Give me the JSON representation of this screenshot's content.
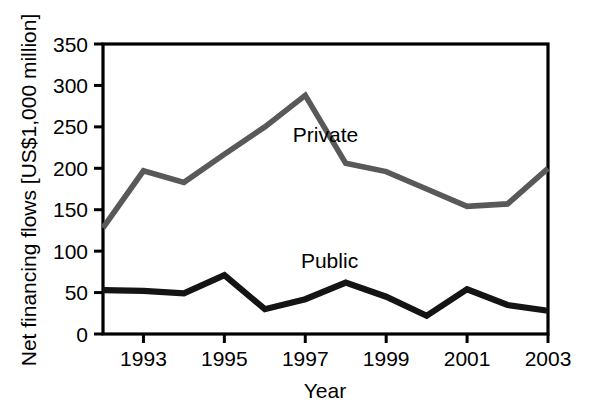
{
  "chart_data": {
    "type": "line",
    "title": "",
    "xlabel": "Year",
    "ylabel": "Net financing flows [US$1,000 million]",
    "x": [
      1992,
      1993,
      1994,
      1995,
      1996,
      1997,
      1998,
      1999,
      2000,
      2001,
      2002,
      2003
    ],
    "xlim": [
      1992,
      2003
    ],
    "ylim": [
      0,
      350
    ],
    "xticks": [
      1993,
      1995,
      1997,
      1999,
      2001,
      2003
    ],
    "xtick_labels": [
      "1993",
      "1995",
      "1997",
      "1999",
      "2001",
      "2003"
    ],
    "yticks": [
      0,
      50,
      100,
      150,
      200,
      250,
      300,
      350
    ],
    "ytick_labels": [
      "0",
      "50",
      "100",
      "150",
      "200",
      "250",
      "300",
      "350"
    ],
    "grid": false,
    "legend_position": "inline-annotations",
    "series": [
      {
        "name": "Private",
        "color": "#595959",
        "label_x": 1997.5,
        "label_y": 232,
        "values": [
          128,
          197,
          183,
          217,
          250,
          288,
          206,
          196,
          175,
          154,
          157,
          200
        ]
      },
      {
        "name": "Public",
        "color": "#141414",
        "label_x": 1997.6,
        "label_y": 80,
        "values": [
          53,
          52,
          49,
          71,
          30,
          42,
          62,
          45,
          22,
          54,
          35,
          28
        ]
      }
    ],
    "annotations": [
      {
        "text": "Private",
        "series": "Private"
      },
      {
        "text": "Public",
        "series": "Public"
      }
    ]
  },
  "axes": {
    "y_axis_title": "Net financing flows [US$1,000 million]",
    "x_axis_title": "Year"
  }
}
